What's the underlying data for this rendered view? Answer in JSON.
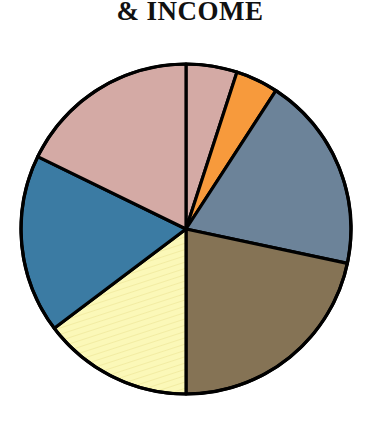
{
  "title": "& INCOME",
  "background_color": "#ffffff",
  "outline_color": "#000000",
  "chart_data": {
    "type": "pie",
    "title": "& INCOME",
    "subtitle": "",
    "xlabel": "",
    "ylabel": "",
    "legend": "none",
    "grid": false,
    "start_angle_deg": 0,
    "direction": "clockwise",
    "center": {
      "x": 186,
      "y": 229
    },
    "radius": 165,
    "categories": [
      "slice-1-pink",
      "slice-2-orange",
      "slice-3-slate-blue",
      "slice-4-brown",
      "slice-5-pale-yellow",
      "slice-6-blue"
    ],
    "values": [
      22.8,
      4.2,
      19.2,
      21.7,
      14.7,
      17.8
    ],
    "slices": [
      {
        "name": "slice-1-pink",
        "label": "",
        "color": "#d4aaa5",
        "pattern": "solid",
        "start_angle_deg": 0,
        "end_angle_deg": 18,
        "percent": 22.8
      },
      {
        "name": "slice-2-orange",
        "label": "",
        "color": "#f79a3c",
        "pattern": "solid",
        "start_angle_deg": 18,
        "end_angle_deg": 33,
        "percent": 4.2
      },
      {
        "name": "slice-3-slate-blue",
        "label": "",
        "color": "#6c8399",
        "pattern": "solid",
        "start_angle_deg": 33,
        "end_angle_deg": 102,
        "percent": 19.2
      },
      {
        "name": "slice-4-brown",
        "label": "",
        "color": "#857355",
        "pattern": "solid",
        "start_angle_deg": 102,
        "end_angle_deg": 180,
        "percent": 21.7
      },
      {
        "name": "slice-5-pale-yellow",
        "label": "",
        "color": "#fbf8b8",
        "pattern": "diagonal-hatch",
        "start_angle_deg": 180,
        "end_angle_deg": 233,
        "percent": 14.7
      },
      {
        "name": "slice-6-blue",
        "label": "",
        "color": "#3b7ba3",
        "pattern": "solid",
        "start_angle_deg": 233,
        "end_angle_deg": 296,
        "percent": 17.8
      },
      {
        "name": "slice-1-pink-wrap",
        "label": "",
        "color": "#d4aaa5",
        "pattern": "solid",
        "start_angle_deg": 296,
        "end_angle_deg": 360,
        "percent": 0
      }
    ]
  }
}
